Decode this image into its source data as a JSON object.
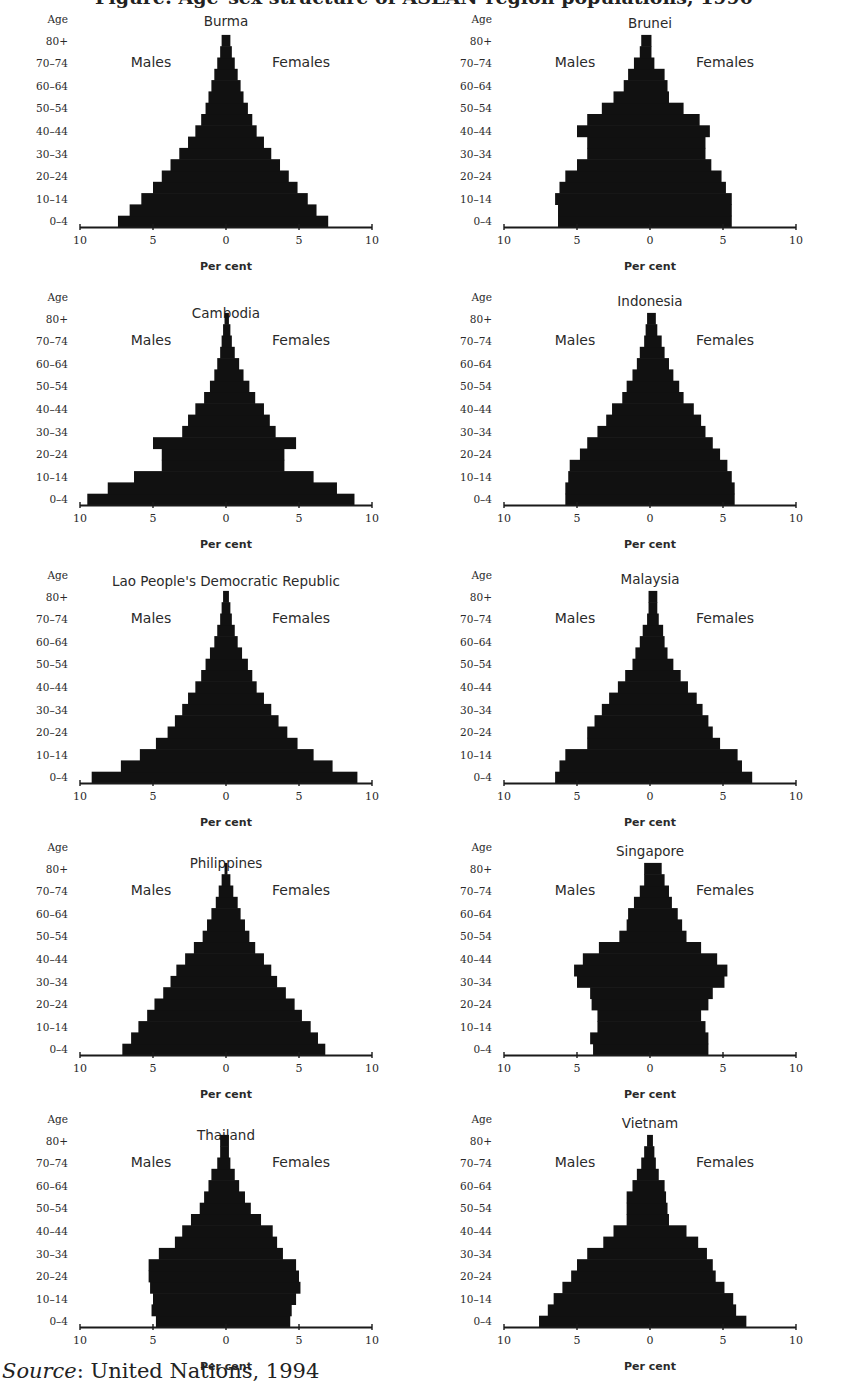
{
  "figure": {
    "title_partial": "Figure: Age–sex structure of ASEAN-region populations, 1990",
    "source_label": "Source",
    "source_text": ": United Nations, 1994"
  },
  "labels": {
    "age_axis": "Age",
    "males": "Males",
    "females": "Females",
    "x_axis": "Per cent",
    "age_ticks": [
      "0–4",
      "10–14",
      "20–24",
      "30–34",
      "40–44",
      "50–54",
      "60–64",
      "70–74",
      "80+"
    ],
    "x_ticks": [
      "10",
      "5",
      "0",
      "5",
      "10"
    ]
  },
  "colors": {
    "bars": "#111111",
    "axis": "#1a1a1a",
    "text": "#2a2a2a",
    "background": "#ffffff"
  },
  "chart_data": [
    {
      "type": "bar",
      "subtype": "population-pyramid",
      "title": "Burma",
      "xlabel": "Per cent",
      "ylabel": "Age",
      "xlim": [
        -10,
        10
      ],
      "categories": [
        "0–4",
        "5–9",
        "10–14",
        "15–19",
        "20–24",
        "25–29",
        "30–34",
        "35–39",
        "40–44",
        "45–49",
        "50–54",
        "55–59",
        "60–64",
        "65–69",
        "70–74",
        "75–79",
        "80+"
      ],
      "series": [
        {
          "name": "Males",
          "values": [
            7.4,
            6.6,
            5.8,
            5.0,
            4.4,
            3.8,
            3.2,
            2.6,
            2.1,
            1.7,
            1.4,
            1.2,
            1.0,
            0.8,
            0.6,
            0.4,
            0.3
          ]
        },
        {
          "name": "Females",
          "values": [
            7.0,
            6.2,
            5.6,
            4.9,
            4.3,
            3.7,
            3.1,
            2.6,
            2.1,
            1.8,
            1.5,
            1.2,
            1.0,
            0.8,
            0.6,
            0.4,
            0.3
          ]
        }
      ]
    },
    {
      "type": "bar",
      "subtype": "population-pyramid",
      "title": "Brunei",
      "xlabel": "Per cent",
      "ylabel": "Age",
      "xlim": [
        -10,
        10
      ],
      "categories": [
        "0–4",
        "5–9",
        "10–14",
        "15–19",
        "20–24",
        "25–29",
        "30–34",
        "35–39",
        "40–44",
        "45–49",
        "50–54",
        "55–59",
        "60–64",
        "65–69",
        "70–74",
        "75–79",
        "80+"
      ],
      "series": [
        {
          "name": "Males",
          "values": [
            6.3,
            6.3,
            6.5,
            6.2,
            5.8,
            5.0,
            4.3,
            4.3,
            5.0,
            4.3,
            3.3,
            2.5,
            1.8,
            1.5,
            1.1,
            0.7,
            0.6
          ]
        },
        {
          "name": "Females",
          "values": [
            5.6,
            5.6,
            5.6,
            5.2,
            4.9,
            4.2,
            3.8,
            3.8,
            4.1,
            3.4,
            2.3,
            1.3,
            1.2,
            1.0,
            0.3,
            0.1,
            0.1
          ]
        }
      ]
    },
    {
      "type": "bar",
      "subtype": "population-pyramid",
      "title": "Cambodia",
      "xlabel": "Per cent",
      "ylabel": "Age",
      "xlim": [
        -10,
        10
      ],
      "categories": [
        "0–4",
        "5–9",
        "10–14",
        "15–19",
        "20–24",
        "25–29",
        "30–34",
        "35–39",
        "40–44",
        "45–49",
        "50–54",
        "55–59",
        "60–64",
        "65–69",
        "70–74",
        "75–79",
        "80+"
      ],
      "series": [
        {
          "name": "Males",
          "values": [
            9.5,
            8.1,
            6.3,
            4.4,
            4.4,
            5.0,
            3.0,
            2.6,
            2.1,
            1.5,
            1.1,
            0.8,
            0.6,
            0.4,
            0.3,
            0.2,
            0.1
          ]
        },
        {
          "name": "Females",
          "values": [
            8.8,
            7.6,
            6.0,
            4.0,
            4.0,
            4.8,
            3.4,
            3.0,
            2.6,
            2.0,
            1.6,
            1.2,
            0.9,
            0.6,
            0.4,
            0.3,
            0.2
          ]
        }
      ]
    },
    {
      "type": "bar",
      "subtype": "population-pyramid",
      "title": "Indonesia",
      "xlabel": "Per cent",
      "ylabel": "Age",
      "xlim": [
        -10,
        10
      ],
      "categories": [
        "0–4",
        "5–9",
        "10–14",
        "15–19",
        "20–24",
        "25–29",
        "30–34",
        "35–39",
        "40–44",
        "45–49",
        "50–54",
        "55–59",
        "60–64",
        "65–69",
        "70–74",
        "75–79",
        "80+"
      ],
      "series": [
        {
          "name": "Males",
          "values": [
            5.8,
            5.8,
            5.6,
            5.5,
            4.8,
            4.3,
            3.6,
            3.0,
            2.6,
            1.9,
            1.6,
            1.2,
            0.9,
            0.7,
            0.4,
            0.3,
            0.2
          ]
        },
        {
          "name": "Females",
          "values": [
            5.8,
            5.8,
            5.6,
            5.3,
            4.8,
            4.3,
            3.8,
            3.5,
            3.0,
            2.3,
            2.0,
            1.6,
            1.3,
            1.0,
            0.8,
            0.5,
            0.4
          ]
        }
      ]
    },
    {
      "type": "bar",
      "subtype": "population-pyramid",
      "title": "Lao People's Democratic Republic",
      "xlabel": "Per cent",
      "ylabel": "Age",
      "xlim": [
        -10,
        10
      ],
      "categories": [
        "0–4",
        "5–9",
        "10–14",
        "15–19",
        "20–24",
        "25–29",
        "30–34",
        "35–39",
        "40–44",
        "45–49",
        "50–54",
        "55–59",
        "60–64",
        "65–69",
        "70–74",
        "75–79",
        "80+"
      ],
      "series": [
        {
          "name": "Males",
          "values": [
            9.2,
            7.2,
            5.9,
            4.8,
            4.0,
            3.5,
            3.0,
            2.6,
            2.1,
            1.7,
            1.4,
            1.1,
            0.8,
            0.6,
            0.4,
            0.3,
            0.2
          ]
        },
        {
          "name": "Females",
          "values": [
            9.0,
            7.3,
            6.0,
            4.9,
            4.2,
            3.6,
            3.1,
            2.6,
            2.1,
            1.8,
            1.5,
            1.1,
            0.8,
            0.6,
            0.4,
            0.3,
            0.2
          ]
        }
      ]
    },
    {
      "type": "bar",
      "subtype": "population-pyramid",
      "title": "Malaysia",
      "xlabel": "Per cent",
      "ylabel": "Age",
      "xlim": [
        -10,
        10
      ],
      "categories": [
        "0–4",
        "5–9",
        "10–14",
        "15–19",
        "20–24",
        "25–29",
        "30–34",
        "35–39",
        "40–44",
        "45–49",
        "50–54",
        "55–59",
        "60–64",
        "65–69",
        "70–74",
        "75–79",
        "80+"
      ],
      "series": [
        {
          "name": "Males",
          "values": [
            6.5,
            6.2,
            5.8,
            4.3,
            4.3,
            3.8,
            3.3,
            2.8,
            2.2,
            1.7,
            1.2,
            1.0,
            0.7,
            0.5,
            0.2,
            0.1,
            0.1
          ]
        },
        {
          "name": "Females",
          "values": [
            7.0,
            6.3,
            6.0,
            4.8,
            4.3,
            4.0,
            3.6,
            3.2,
            2.6,
            2.1,
            1.6,
            1.2,
            1.0,
            0.9,
            0.6,
            0.5,
            0.5
          ]
        }
      ]
    },
    {
      "type": "bar",
      "subtype": "population-pyramid",
      "title": "Philippines",
      "xlabel": "Per cent",
      "ylabel": "Age",
      "xlim": [
        -10,
        10
      ],
      "categories": [
        "0–4",
        "5–9",
        "10–14",
        "15–19",
        "20–24",
        "25–29",
        "30–34",
        "35–39",
        "40–44",
        "45–49",
        "50–54",
        "55–59",
        "60–64",
        "65–69",
        "70–74",
        "75–79",
        "80+"
      ],
      "series": [
        {
          "name": "Males",
          "values": [
            7.1,
            6.5,
            6.0,
            5.4,
            4.9,
            4.3,
            3.8,
            3.4,
            2.8,
            2.2,
            1.6,
            1.3,
            1.0,
            0.7,
            0.5,
            0.3,
            0.1
          ]
        },
        {
          "name": "Females",
          "values": [
            6.8,
            6.3,
            5.8,
            5.2,
            4.7,
            4.1,
            3.5,
            3.1,
            2.6,
            2.0,
            1.6,
            1.3,
            1.0,
            0.8,
            0.5,
            0.3,
            0.1
          ]
        }
      ]
    },
    {
      "type": "bar",
      "subtype": "population-pyramid",
      "title": "Singapore",
      "xlabel": "Per cent",
      "ylabel": "Age",
      "xlim": [
        -10,
        10
      ],
      "categories": [
        "0–4",
        "5–9",
        "10–14",
        "15–19",
        "20–24",
        "25–29",
        "30–34",
        "35–39",
        "40–44",
        "45–49",
        "50–54",
        "55–59",
        "60–64",
        "65–69",
        "70–74",
        "75–79",
        "80+"
      ],
      "series": [
        {
          "name": "Males",
          "values": [
            3.9,
            4.1,
            3.6,
            3.6,
            4.0,
            4.1,
            5.0,
            5.2,
            4.6,
            3.5,
            2.1,
            1.6,
            1.5,
            1.1,
            0.7,
            0.4,
            0.4
          ]
        },
        {
          "name": "Females",
          "values": [
            4.0,
            4.0,
            3.8,
            3.5,
            4.0,
            4.3,
            5.1,
            5.3,
            4.6,
            3.5,
            2.5,
            2.2,
            1.9,
            1.5,
            1.3,
            1.0,
            0.8
          ]
        }
      ]
    },
    {
      "type": "bar",
      "subtype": "population-pyramid",
      "title": "Thailand",
      "xlabel": "Per cent",
      "ylabel": "Age",
      "xlim": [
        -10,
        10
      ],
      "categories": [
        "0–4",
        "5–9",
        "10–14",
        "15–19",
        "20–24",
        "25–29",
        "30–34",
        "35–39",
        "40–44",
        "45–49",
        "50–54",
        "55–59",
        "60–64",
        "65–69",
        "70–74",
        "75–79",
        "80+"
      ],
      "series": [
        {
          "name": "Males",
          "values": [
            4.8,
            5.1,
            5.0,
            5.2,
            5.3,
            5.3,
            4.6,
            3.5,
            3.0,
            2.4,
            1.8,
            1.5,
            1.2,
            1.0,
            0.6,
            0.4,
            0.4
          ]
        },
        {
          "name": "Females",
          "values": [
            4.4,
            4.5,
            4.8,
            5.1,
            5.0,
            4.8,
            3.9,
            3.5,
            3.2,
            2.4,
            1.7,
            1.3,
            0.9,
            0.6,
            0.3,
            0.2,
            0.2
          ]
        }
      ]
    },
    {
      "type": "bar",
      "subtype": "population-pyramid",
      "title": "Vietnam",
      "xlabel": "Per cent",
      "ylabel": "Age",
      "xlim": [
        -10,
        10
      ],
      "categories": [
        "0–4",
        "5–9",
        "10–14",
        "15–19",
        "20–24",
        "25–29",
        "30–34",
        "35–39",
        "40–44",
        "45–49",
        "50–54",
        "55–59",
        "60–64",
        "65–69",
        "70–74",
        "75–79",
        "80+"
      ],
      "series": [
        {
          "name": "Males",
          "values": [
            7.6,
            7.0,
            6.6,
            6.0,
            5.4,
            5.0,
            4.3,
            3.2,
            2.5,
            1.6,
            1.6,
            1.6,
            1.2,
            0.9,
            0.6,
            0.4,
            0.2
          ]
        },
        {
          "name": "Females",
          "values": [
            6.6,
            5.9,
            5.7,
            5.1,
            4.5,
            4.3,
            3.9,
            3.3,
            2.5,
            1.3,
            1.2,
            1.1,
            1.0,
            0.6,
            0.4,
            0.3,
            0.2
          ]
        }
      ]
    }
  ],
  "layout": {
    "panels": [
      {
        "left": 0,
        "top": 10,
        "age_top": 8
      },
      {
        "left": 424,
        "top": 10,
        "age_top": 20
      },
      {
        "left": 0,
        "top": 288,
        "age_top": 22
      },
      {
        "left": 424,
        "top": 288,
        "age_top": 20
      },
      {
        "left": 0,
        "top": 566,
        "age_top": 22
      },
      {
        "left": 424,
        "top": 566,
        "age_top": 22
      },
      {
        "left": 0,
        "top": 838,
        "age_top": 22
      },
      {
        "left": 424,
        "top": 838,
        "age_top": 22
      },
      {
        "left": 0,
        "top": 1110,
        "age_top": 22
      },
      {
        "left": 424,
        "top": 1110,
        "age_top": 22
      }
    ]
  }
}
